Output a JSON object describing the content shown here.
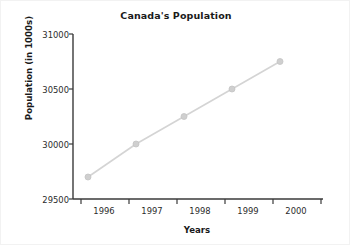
{
  "chart_data": {
    "type": "line",
    "title": "Canada's Population",
    "xlabel": "Years",
    "ylabel": "Population (in 1000s)",
    "categories": [
      "1996",
      "1997",
      "1998",
      "1999",
      "2000"
    ],
    "values": [
      29700,
      30000,
      30250,
      30500,
      30750
    ],
    "series": [
      {
        "name": "Population",
        "values": [
          29700,
          30000,
          30250,
          30500,
          30750
        ]
      }
    ],
    "ylim": [
      29500,
      31000
    ],
    "yticks": [
      29500,
      30000,
      30500,
      31000
    ],
    "ytick_labels": [
      "29500",
      "30000",
      "30500",
      "31000"
    ],
    "grid": false,
    "legend": "none",
    "line_color": "#d4d4d4",
    "marker_color": "#cfcfcf",
    "axis_color": "#3a3a3a",
    "text_color": "#1a1a1a",
    "background": "#ffffff"
  }
}
